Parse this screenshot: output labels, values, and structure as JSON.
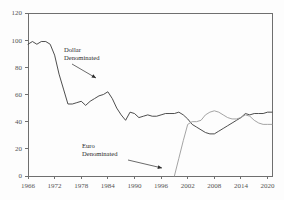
{
  "chart_data": {
    "type": "line",
    "title": "",
    "subtitle": "",
    "xlabel": "",
    "ylabel": "",
    "xlim": [
      1966,
      2021
    ],
    "ylim": [
      0,
      120
    ],
    "grid": false,
    "legend_position": "none",
    "x_ticks": [
      "1966",
      "1972",
      "1978",
      "1984",
      "1990",
      "1996",
      "2002",
      "2008",
      "2014",
      "2020"
    ],
    "x_tick_values": [
      1966,
      1972,
      1978,
      1984,
      1990,
      1996,
      2002,
      2008,
      2014,
      2020
    ],
    "y_ticks": [
      "0",
      "20",
      "40",
      "60",
      "80",
      "100",
      "120"
    ],
    "y_tick_values": [
      0,
      20,
      40,
      60,
      80,
      100,
      120
    ],
    "series": [
      {
        "name": "Dollar Denominated",
        "color": "#3a3a3a",
        "width": 0.9,
        "x": [
          1966,
          1967,
          1968,
          1969,
          1970,
          1971,
          1972,
          1973,
          1974,
          1975,
          1976,
          1977,
          1978,
          1979,
          1980,
          1981,
          1982,
          1983,
          1984,
          1985,
          1986,
          1987,
          1988,
          1989,
          1990,
          1991,
          1992,
          1993,
          1994,
          1995,
          1996,
          1997,
          1998,
          1999,
          2000,
          2001,
          2002,
          2003,
          2004,
          2005,
          2006,
          2007,
          2008,
          2009,
          2010,
          2011,
          2012,
          2013,
          2014,
          2015,
          2016,
          2017,
          2018,
          2019,
          2020,
          2021
        ],
        "values": [
          97,
          99,
          97,
          99,
          99,
          97,
          89,
          75,
          64,
          53,
          53,
          54,
          55,
          52,
          55,
          57,
          59,
          60,
          62,
          57,
          50,
          45,
          41,
          47,
          46,
          43,
          44,
          45,
          44,
          44,
          45,
          46,
          46,
          46,
          47,
          45,
          42,
          38,
          36,
          34,
          32,
          31,
          31,
          33,
          35,
          37,
          39,
          41,
          43,
          46,
          45,
          46,
          46,
          46,
          47,
          47
        ]
      },
      {
        "name": "Euro Denominated",
        "color": "#9a9a9a",
        "width": 0.9,
        "x": [
          1999,
          2000,
          2001,
          2002,
          2003,
          2004,
          2005,
          2006,
          2007,
          2008,
          2009,
          2010,
          2011,
          2012,
          2013,
          2014,
          2015,
          2016,
          2017,
          2018,
          2019,
          2020,
          2021
        ],
        "values": [
          0,
          13,
          26,
          38,
          40,
          40,
          41,
          45,
          47,
          48,
          47,
          45,
          43,
          42,
          42,
          43,
          45,
          44,
          41,
          39,
          38,
          38,
          38
        ]
      }
    ],
    "annotations": [
      {
        "name": "dollar-denominated-annotation",
        "lines": [
          "Dollar",
          "Denominated"
        ],
        "text_x": 64,
        "text_y": 52,
        "arrow_from_x": 72,
        "arrow_from_y": 64,
        "arrow_to_x": 96,
        "arrow_to_y": 78
      },
      {
        "name": "euro-denominated-annotation",
        "lines": [
          "Euro",
          "Denominated"
        ],
        "text_x": 82,
        "text_y": 148,
        "arrow_from_x": 128,
        "arrow_from_y": 160,
        "arrow_to_x": 162,
        "arrow_to_y": 168
      }
    ]
  },
  "plot": {
    "left": 28,
    "right": 272,
    "top": 13,
    "bottom": 176
  },
  "colors": {
    "background": "#fdfdfd",
    "axis": "#6f6f6f",
    "tick_text": "#555555",
    "dollar_series": "#3a3a3a",
    "euro_series": "#9a9a9a",
    "annotation_text": "#2b2b2b"
  }
}
